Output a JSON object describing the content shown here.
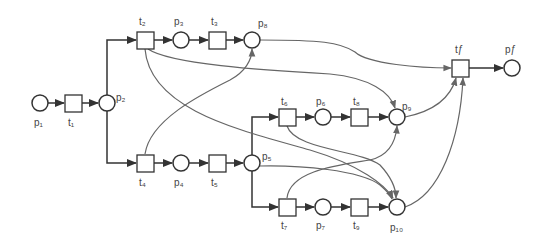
{
  "diagram": {
    "type": "petri-net",
    "places": [
      {
        "id": "p1",
        "label": "p₁",
        "x": 40,
        "y": 103
      },
      {
        "id": "p2",
        "label": "p₂",
        "x": 107,
        "y": 103
      },
      {
        "id": "p3",
        "label": "p₃",
        "x": 181,
        "y": 40
      },
      {
        "id": "p8",
        "label": "p₈",
        "x": 252,
        "y": 40
      },
      {
        "id": "p4",
        "label": "p₄",
        "x": 181,
        "y": 163
      },
      {
        "id": "p5",
        "label": "p₅",
        "x": 252,
        "y": 163
      },
      {
        "id": "p6",
        "label": "p₆",
        "x": 323,
        "y": 117
      },
      {
        "id": "p9",
        "label": "p₉",
        "x": 397,
        "y": 117
      },
      {
        "id": "p7",
        "label": "p₇",
        "x": 323,
        "y": 207
      },
      {
        "id": "p10",
        "label": "p₁₀",
        "x": 397,
        "y": 207
      },
      {
        "id": "pf",
        "label": "pƒ",
        "x": 512,
        "y": 68
      }
    ],
    "transitions": [
      {
        "id": "t1",
        "label": "t₁",
        "x": 73,
        "y": 103
      },
      {
        "id": "t2",
        "label": "t₂",
        "x": 145,
        "y": 40
      },
      {
        "id": "t3",
        "label": "t₃",
        "x": 217,
        "y": 40
      },
      {
        "id": "t4",
        "label": "t₄",
        "x": 145,
        "y": 163
      },
      {
        "id": "t5",
        "label": "t₅",
        "x": 217,
        "y": 163
      },
      {
        "id": "t6",
        "label": "t₆",
        "x": 287,
        "y": 117
      },
      {
        "id": "t8",
        "label": "t₈",
        "x": 359,
        "y": 117
      },
      {
        "id": "t7",
        "label": "t₇",
        "x": 287,
        "y": 207
      },
      {
        "id": "t9",
        "label": "t₉",
        "x": 359,
        "y": 207
      },
      {
        "id": "tf",
        "label": "tƒ",
        "x": 460,
        "y": 68
      }
    ],
    "arcs": [
      [
        "p1",
        "t1"
      ],
      [
        "t1",
        "p2"
      ],
      [
        "p2",
        "t2"
      ],
      [
        "p2",
        "t4"
      ],
      [
        "t2",
        "p3"
      ],
      [
        "p3",
        "t3"
      ],
      [
        "t3",
        "p8"
      ],
      [
        "t4",
        "p4"
      ],
      [
        "p4",
        "t5"
      ],
      [
        "t5",
        "p5"
      ],
      [
        "p5",
        "t6"
      ],
      [
        "p5",
        "t7"
      ],
      [
        "t6",
        "p6"
      ],
      [
        "p6",
        "t8"
      ],
      [
        "t8",
        "p9"
      ],
      [
        "t7",
        "p7"
      ],
      [
        "p7",
        "t9"
      ],
      [
        "t9",
        "p10"
      ],
      [
        "p8",
        "tf"
      ],
      [
        "t2",
        "p9"
      ],
      [
        "t2",
        "p10"
      ],
      [
        "t4",
        "p8"
      ],
      [
        "t6",
        "p10"
      ],
      [
        "p5",
        "p10"
      ],
      [
        "t7",
        "p9"
      ],
      [
        "p9",
        "tf"
      ],
      [
        "p10",
        "tf"
      ],
      [
        "tf",
        "pf"
      ]
    ]
  }
}
